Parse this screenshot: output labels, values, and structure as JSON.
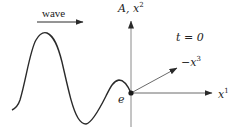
{
  "diagram": {
    "type": "wave-pulse-coordinate-diagram",
    "colors": {
      "curve": "#2a2a2a",
      "axes": "#8a8a8a",
      "arrows": "#2a2a2a",
      "text": "#222222",
      "background": "#ffffff"
    },
    "labels": {
      "direction": "wave",
      "vertical_axis_main": "A, x",
      "vertical_axis_sup": "2",
      "time": "t = 0",
      "diagonal_axis_main": "−x",
      "diagonal_axis_sup": "3",
      "horizontal_axis_main": "x",
      "horizontal_axis_sup": "1",
      "origin_point": "e"
    },
    "elements": {
      "direction_arrow": {
        "from": [
          37,
          22
        ],
        "to": [
          83,
          22
        ]
      },
      "vertical_axis": {
        "from": [
          131,
          127
        ],
        "to": [
          131,
          20
        ]
      },
      "horizontal_axis": {
        "from": [
          131,
          93
        ],
        "to": [
          212,
          93
        ]
      },
      "diagonal_axis": {
        "from": [
          131,
          93
        ],
        "to": [
          177,
          68
        ]
      },
      "origin": [
        131,
        93
      ],
      "wave_curve_points": [
        [
          12,
          110
        ],
        [
          45,
          33
        ],
        [
          84,
          124
        ],
        [
          117,
          80
        ],
        [
          131,
          93
        ]
      ]
    }
  }
}
